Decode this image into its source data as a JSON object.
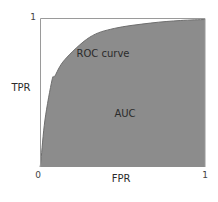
{
  "chart_data": {
    "type": "area",
    "title": "",
    "xlabel": "FPR",
    "ylabel": "TPR",
    "xlim": [
      0,
      1
    ],
    "ylim": [
      0,
      1
    ],
    "x_ticks": [
      "0",
      "1"
    ],
    "y_ticks": [
      "1"
    ],
    "grid": false,
    "legend": null,
    "series": [
      {
        "name": "ROC curve",
        "x": [
          0.0,
          0.006,
          0.03,
          0.073,
          0.09,
          0.15,
          0.3,
          0.45,
          0.67,
          0.85,
          1.0
        ],
        "y": [
          0.0,
          0.047,
          0.315,
          0.584,
          0.61,
          0.72,
          0.87,
          0.93,
          0.966,
          0.983,
          0.99
        ]
      }
    ],
    "annotations": [
      {
        "text": "ROC curve",
        "x": 0.38,
        "y": 0.77
      },
      {
        "text": "AUC",
        "x": 0.51,
        "y": 0.36
      }
    ],
    "colors": {
      "area_fill": "#8c8c8c",
      "curve": "#6e6e6e",
      "frame": "#9a9a9a",
      "text": "#2b2b2b"
    }
  },
  "labels": {
    "x_axis": "FPR",
    "y_axis": "TPR",
    "x_tick_min": "0",
    "x_tick_max": "1",
    "y_tick_max": "1",
    "curve_label": "ROC curve",
    "area_label": "AUC"
  }
}
